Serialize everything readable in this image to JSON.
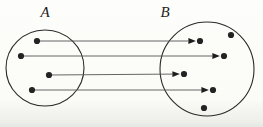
{
  "figure": {
    "colors": {
      "ink": "#1e1e1e",
      "dot": "#232323",
      "arrow_line": "#555555",
      "circle_stroke": "#2a2a2a"
    },
    "sets": [
      {
        "id": "A",
        "label": "A",
        "cx": 45,
        "cy": 68,
        "rx": 39,
        "ry": 38,
        "points": [
          {
            "id": "a1",
            "x": 37,
            "y": 41
          },
          {
            "id": "a2",
            "x": 21,
            "y": 56
          },
          {
            "id": "a3",
            "x": 49,
            "y": 75
          },
          {
            "id": "a4",
            "x": 32,
            "y": 90
          }
        ]
      },
      {
        "id": "B",
        "label": "B",
        "cx": 207,
        "cy": 69,
        "rx": 47,
        "ry": 47,
        "points": [
          {
            "id": "b1",
            "x": 200,
            "y": 41
          },
          {
            "id": "b2",
            "x": 224,
            "y": 56
          },
          {
            "id": "b3",
            "x": 184,
            "y": 74
          },
          {
            "id": "b4",
            "x": 213,
            "y": 90
          },
          {
            "id": "b5",
            "x": 231,
            "y": 35
          },
          {
            "id": "b6",
            "x": 204,
            "y": 108
          }
        ]
      }
    ],
    "mappings": [
      {
        "from": "a1",
        "to": "b1"
      },
      {
        "from": "a2",
        "to": "b2"
      },
      {
        "from": "a3",
        "to": "b3"
      },
      {
        "from": "a4",
        "to": "b4"
      }
    ],
    "dot_radius": 3.1
  }
}
